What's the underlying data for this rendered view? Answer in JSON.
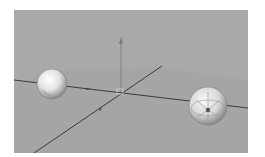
{
  "viewport": {
    "background": "#a9a9a9",
    "grid_plane_color": "#a0a0a0",
    "axis_color": "#3a3a3a",
    "objects": [
      {
        "name": "sphere-left",
        "type": "sphere",
        "cx": 38,
        "cy": 74,
        "r": 15
      },
      {
        "name": "sphere-right",
        "type": "sphere-wireframe",
        "cx": 194,
        "cy": 96,
        "r": 19
      }
    ],
    "gizmo": {
      "origin_x": 108,
      "origin_y": 82
    }
  }
}
